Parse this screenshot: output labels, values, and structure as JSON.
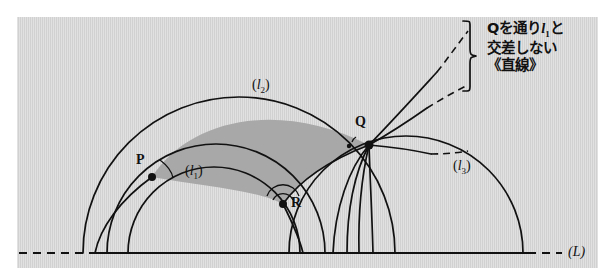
{
  "figure": {
    "kind": "poincare-half-plane-hyperbolic-geometry-diagram",
    "panel_color": "#d7d7d7",
    "shade_color": "#a8a8a8",
    "ink_color": "#111111",
    "baseline_label": "(L)",
    "points": [
      {
        "id": "P",
        "label": "P",
        "x": 152,
        "y": 177
      },
      {
        "id": "Q",
        "label": "Q",
        "x": 369,
        "y": 145
      },
      {
        "id": "R",
        "label": "R",
        "x": 283,
        "y": 204
      }
    ],
    "curve_labels": [
      {
        "id": "l1",
        "paren_open": "(",
        "base": "l",
        "sub": "1",
        "paren_close": ")",
        "x": 196,
        "y": 172
      },
      {
        "id": "l2",
        "paren_open": "(",
        "base": "l",
        "sub": "2",
        "paren_close": ")",
        "x": 262,
        "y": 86
      },
      {
        "id": "l3",
        "paren_open": "(",
        "base": "l",
        "sub": "3",
        "paren_close": ")",
        "x": 462,
        "y": 164
      }
    ],
    "annotation": {
      "line1_pre": "Qを通り",
      "line1_italic": "l",
      "line1_sub": "1",
      "line1_post": "と",
      "line2": "交差しない",
      "line3": "《直線》"
    }
  }
}
